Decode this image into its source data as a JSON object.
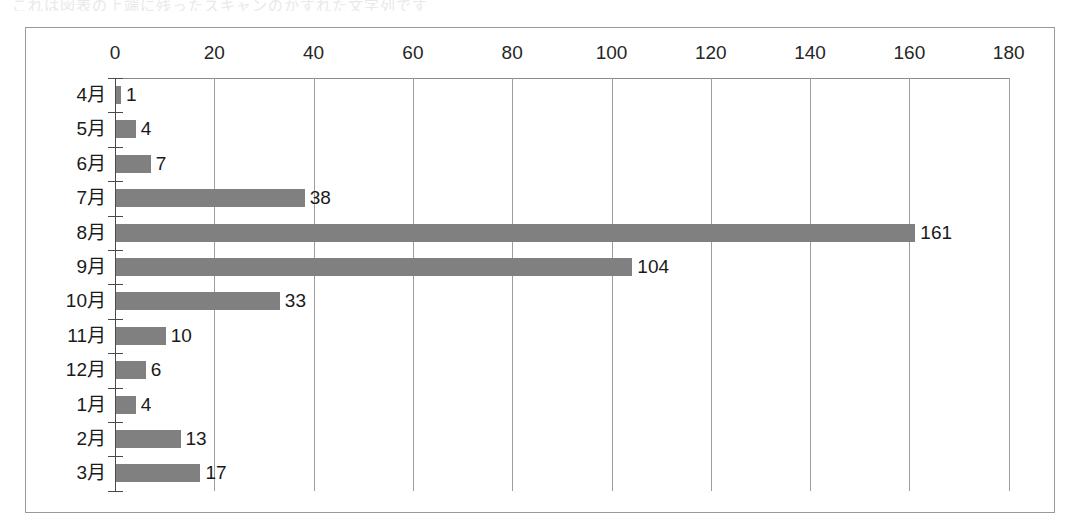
{
  "artifact_text": "これは図表の上端に残ったスキャンのかすれた文字列です",
  "chart_data": {
    "type": "bar",
    "orientation": "horizontal",
    "title": "",
    "subtitle": "",
    "xlabel": "",
    "ylabel": "",
    "categories": [
      "4月",
      "5月",
      "6月",
      "7月",
      "8月",
      "9月",
      "10月",
      "11月",
      "12月",
      "1月",
      "2月",
      "3月"
    ],
    "values": [
      1,
      4,
      7,
      38,
      161,
      104,
      33,
      10,
      6,
      4,
      13,
      17
    ],
    "data_labels": [
      "1",
      "4",
      "7",
      "38",
      "161",
      "104",
      "33",
      "10",
      "6",
      "4",
      "13",
      "17"
    ],
    "xticks": [
      0,
      20,
      40,
      60,
      80,
      100,
      120,
      140,
      160,
      180
    ],
    "xtick_labels": [
      "0",
      "20",
      "40",
      "60",
      "80",
      "100",
      "120",
      "140",
      "160",
      "180"
    ],
    "xlim": [
      0,
      180
    ],
    "grid": true,
    "grid_axis": "x",
    "legend": false,
    "legend_position": "none",
    "bar_color": "#808080",
    "axis_color": "#4a4a4a",
    "grid_color": "#9d9d9d",
    "frame_color": "#9a9a9a",
    "background_color": "#ffffff"
  }
}
